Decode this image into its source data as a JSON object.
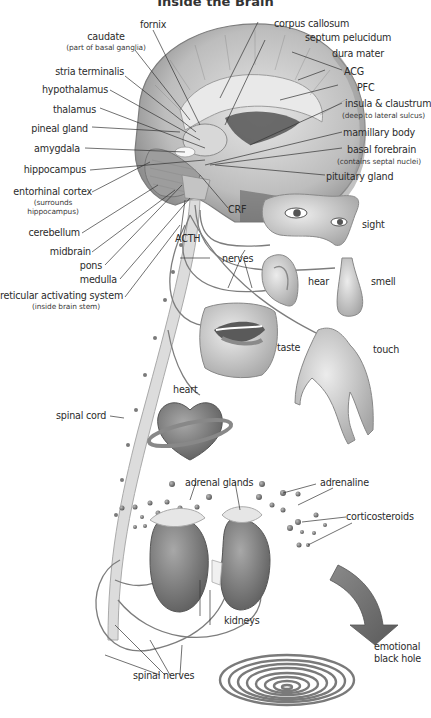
{
  "title": "Inside the Brain",
  "brain_labels": {
    "fornix": "fornix",
    "caudate": "caudate",
    "caudate_note": "(part of basal ganglia)",
    "corpus_callosum": "corpus callosum",
    "septum_pelucidum": "septum pelucidum",
    "dura_mater": "dura mater",
    "acg": "ACG",
    "pfc": "PFC",
    "insula": "insula & claustrum",
    "insula_note": "(deep to lateral sulcus)",
    "mamillary_body": "mamillary body",
    "basal_forebrain": "basal forebrain",
    "basal_forebrain_note": "(contains septal nuclei)",
    "pituitary_gland": "pituitary gland",
    "stria_terminalis": "stria terminalis",
    "hypothalamus": "hypothalamus",
    "thalamus": "thalamus",
    "pineal_gland": "pineal gland",
    "amygdala": "amygdala",
    "hippocampus": "hippocampus",
    "entorhinal_cortex": "entorhinal cortex",
    "entorhinal_note_1": "(surrounds",
    "entorhinal_note_2": "hippocampus)",
    "cerebellum": "cerebellum",
    "midbrain": "midbrain",
    "pons": "pons",
    "medulla": "medulla",
    "ras": "reticular activating system",
    "ras_note": "(inside brain stem)"
  },
  "hormone_labels": {
    "crf": "CRF",
    "acth": "ACTH",
    "nerves": "nerves"
  },
  "senses": {
    "sight": "sight",
    "hear": "hear",
    "smell": "smell",
    "taste": "taste",
    "touch": "touch"
  },
  "body_labels": {
    "heart": "heart",
    "spinal_cord": "spinal cord",
    "adrenal_glands": "adrenal glands",
    "adrenaline": "adrenaline",
    "corticosteroids": "corticosteroids",
    "kidneys": "kidneys",
    "spinal_nerves": "spinal nerves",
    "emotional_1": "emotional",
    "emotional_2": "black hole"
  },
  "colors": {
    "organ_gray": "#7a7a7a",
    "light_gray": "#c8c8c8",
    "line": "#555555",
    "text": "#2b2b2b"
  }
}
